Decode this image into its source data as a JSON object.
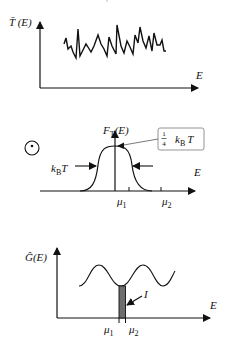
{
  "colors": {
    "ink": "#111111",
    "bar_fill": "#6e6e6e",
    "box_stroke": "#777777",
    "background": "#ffffff"
  },
  "panels": [
    {
      "id": "transmission",
      "y_label": "T̄ (E)",
      "x_label": "E",
      "curve": "noisy-fluctuating-signal"
    },
    {
      "id": "fermi-window",
      "y_label_main": "F",
      "y_label_sub": "T",
      "y_label_tail": "(E)",
      "x_label": "E",
      "width_label_main": "k",
      "width_label_sub": "B",
      "width_label_tail": "T",
      "annotation": {
        "fraction_num": "1",
        "fraction_den": "4",
        "text_main": "k",
        "text_sub": "B",
        "text_tail": "T"
      },
      "ticks": [
        {
          "main": "μ",
          "sub": "1"
        },
        {
          "main": "μ",
          "sub": "2"
        }
      ],
      "symbol": "circle-dot"
    },
    {
      "id": "conductance",
      "y_label": "Ĝ(E)",
      "x_label": "E",
      "bar_label": "I",
      "ticks": [
        {
          "main": "μ",
          "sub": "1"
        },
        {
          "main": "μ",
          "sub": "2"
        }
      ],
      "curve": "oscillating-wave"
    }
  ]
}
